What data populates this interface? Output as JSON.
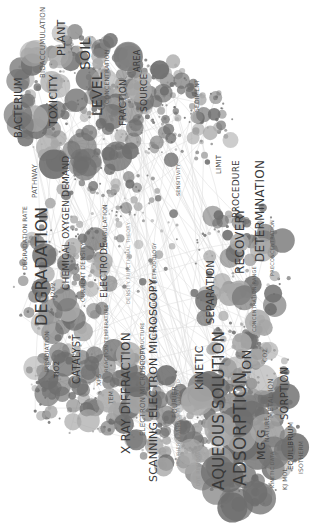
{
  "visualization": {
    "type": "term co-occurrence network",
    "orientation": "rotated 90deg counter-clockwise",
    "colors": {
      "background": "#ffffff",
      "node": "#6e6e6e",
      "node_light": "#a8a8a8",
      "edge": "#d6d6d6",
      "label": "#3a3a3a"
    }
  },
  "chart_data": {
    "type": "network",
    "clusters": [
      {
        "name": "environment",
        "nodes": [
          "SOIL",
          "LEVEL",
          "PLANT",
          "TOXICITY",
          "BACTERIUM",
          "BIOACCUMULATION",
          "FRACTION",
          "SOURCE",
          "AREA",
          "CONCENTRATION",
          "SEDIMENT",
          "LIMIT",
          "SENSITIVITY",
          "PATHWAY"
        ]
      },
      {
        "name": "degradation",
        "nodes": [
          "DEGRADATION",
          "DEGRADATION RATE",
          "CHEMICAL OXYGEN DEMAND",
          "CATALYST",
          "TIO2",
          "IRRADIATION",
          "ELECTRODE",
          "CURRENT DENSITY",
          "COAGULATION",
          "H2O2",
          "REACTION TEMPERATURE",
          "XPS",
          "TEM"
        ]
      },
      {
        "name": "characterization",
        "nodes": [
          "X RAY DIFFRACTION",
          "SCANNING ELECTRON MICROSCOPY",
          "ELECTRON MICROSCOPY",
          "FOURIER",
          "MICROSTRUCTURE",
          "RESPONSE SURFACE METHODOLOGY",
          "DENSITY FUNCTIONAL THEORY",
          "FOURIER TRANSFORM INFRARED",
          "DYE REMOVAL"
        ]
      },
      {
        "name": "adsorption",
        "nodes": [
          "ADSORPTION",
          "AQUEOUS SOLUTION",
          "ION",
          "KINETIC",
          "SORPTION",
          "MG G",
          "NATURE",
          "METAL ION",
          "EQUILIBRIUM",
          "ISOTHERM",
          "KINETIC DATA",
          "KJ MOL",
          "FREUNDLICH",
          "CO2"
        ]
      },
      {
        "name": "analysis",
        "nodes": [
          "DETERMINATION",
          "RECOVERY",
          "PROCEDURE",
          "SEPARATION",
          "CONCENTRATION RANGE",
          "PRECONCENTRATION"
        ]
      }
    ]
  },
  "labels": [
    {
      "text": "SOIL",
      "x": 78,
      "y": 70,
      "size": 14,
      "cls": ""
    },
    {
      "text": "LEVEL",
      "x": 90,
      "y": 116,
      "size": 14,
      "cls": ""
    },
    {
      "text": "PLANT",
      "x": 56,
      "y": 56,
      "size": 11,
      "cls": ""
    },
    {
      "text": "TOXICITY",
      "x": 48,
      "y": 126,
      "size": 11,
      "cls": ""
    },
    {
      "text": "BACTERIUM",
      "x": 14,
      "y": 138,
      "size": 10,
      "cls": ""
    },
    {
      "text": "BIOACCUMULATION",
      "x": 40,
      "y": 78,
      "size": 7,
      "cls": "mid"
    },
    {
      "text": "FRACTION",
      "x": 119,
      "y": 126,
      "size": 9,
      "cls": ""
    },
    {
      "text": "SOURCE",
      "x": 140,
      "y": 112,
      "size": 9,
      "cls": ""
    },
    {
      "text": "AREA",
      "x": 134,
      "y": 72,
      "size": 8,
      "cls": ""
    },
    {
      "text": "CONCENTRATION",
      "x": 104,
      "y": 104,
      "size": 6,
      "cls": "mid"
    },
    {
      "text": "SEDIMENT",
      "x": 194,
      "y": 112,
      "size": 6,
      "cls": "mid"
    },
    {
      "text": "LIMIT",
      "x": 216,
      "y": 174,
      "size": 7,
      "cls": ""
    },
    {
      "text": "SENSITIVITY",
      "x": 176,
      "y": 196,
      "size": 5,
      "cls": "mid"
    },
    {
      "text": "PATHWAY",
      "x": 32,
      "y": 198,
      "size": 7,
      "cls": "mid"
    },
    {
      "text": "DEGRADATION RATE",
      "x": 22,
      "y": 270,
      "size": 6,
      "cls": "mid"
    },
    {
      "text": "DEGRADATION",
      "x": 34,
      "y": 326,
      "size": 16,
      "cls": ""
    },
    {
      "text": "CHEMICAL OXYGEN DEMAND",
      "x": 62,
      "y": 290,
      "size": 9,
      "cls": ""
    },
    {
      "text": "H2O2",
      "x": 50,
      "y": 300,
      "size": 6,
      "cls": "mid"
    },
    {
      "text": "CURRENT DENSITY",
      "x": 80,
      "y": 302,
      "size": 6,
      "cls": "mid"
    },
    {
      "text": "ELECTRODE",
      "x": 100,
      "y": 298,
      "size": 9,
      "cls": ""
    },
    {
      "text": "COAGULATION",
      "x": 102,
      "y": 250,
      "size": 6,
      "cls": "mid"
    },
    {
      "text": "IRRADIATION",
      "x": 44,
      "y": 372,
      "size": 6,
      "cls": "mid"
    },
    {
      "text": "TIO2",
      "x": 54,
      "y": 378,
      "size": 7,
      "cls": ""
    },
    {
      "text": "CATALYST",
      "x": 72,
      "y": 384,
      "size": 10,
      "cls": ""
    },
    {
      "text": "REACTION TEMPERATURE",
      "x": 104,
      "y": 372,
      "size": 5,
      "cls": "mid"
    },
    {
      "text": "XPS",
      "x": 96,
      "y": 386,
      "size": 6,
      "cls": "mid"
    },
    {
      "text": "TEM",
      "x": 108,
      "y": 404,
      "size": 6,
      "cls": "mid"
    },
    {
      "text": "MICROSTRUCTURE",
      "x": 140,
      "y": 372,
      "size": 5,
      "cls": "mid"
    },
    {
      "text": "RESPONSE SURFACE METHODOLOGY",
      "x": 152,
      "y": 340,
      "size": 5,
      "cls": "mid"
    },
    {
      "text": "DENSITY FUNCTIONAL THEORY",
      "x": 126,
      "y": 304,
      "size": 5,
      "cls": "faint"
    },
    {
      "text": "X RAY DIFFRACTION",
      "x": 120,
      "y": 454,
      "size": 12,
      "cls": ""
    },
    {
      "text": "ELECTRON MICROSCOPY",
      "x": 140,
      "y": 436,
      "size": 7,
      "cls": "mid"
    },
    {
      "text": "SCANNING ELECTRON MICROSCOPY",
      "x": 148,
      "y": 482,
      "size": 11,
      "cls": ""
    },
    {
      "text": "FOURIER",
      "x": 172,
      "y": 418,
      "size": 7,
      "cls": "mid"
    },
    {
      "text": "FOURIER TRANSFORM INFRARED",
      "x": 176,
      "y": 466,
      "size": 5,
      "cls": "faint"
    },
    {
      "text": "DYE REMOVAL",
      "x": 196,
      "y": 486,
      "size": 5,
      "cls": "faint"
    },
    {
      "text": "KINETIC",
      "x": 194,
      "y": 390,
      "size": 11,
      "cls": ""
    },
    {
      "text": "AQUEOUS SOLUTION",
      "x": 212,
      "y": 490,
      "size": 15,
      "cls": ""
    },
    {
      "text": "ADSORPTION",
      "x": 232,
      "y": 486,
      "size": 17,
      "cls": ""
    },
    {
      "text": "ION",
      "x": 240,
      "y": 374,
      "size": 13,
      "cls": ""
    },
    {
      "text": "MG G",
      "x": 256,
      "y": 460,
      "size": 11,
      "cls": ""
    },
    {
      "text": "NATURE",
      "x": 264,
      "y": 442,
      "size": 6,
      "cls": "mid"
    },
    {
      "text": "METAL ION",
      "x": 268,
      "y": 418,
      "size": 7,
      "cls": "mid"
    },
    {
      "text": "CO2",
      "x": 262,
      "y": 362,
      "size": 6,
      "cls": "mid"
    },
    {
      "text": "SORPTION",
      "x": 280,
      "y": 420,
      "size": 10,
      "cls": ""
    },
    {
      "text": "EQUILIBRIUM",
      "x": 288,
      "y": 470,
      "size": 7,
      "cls": ""
    },
    {
      "text": "ISOTHERM",
      "x": 298,
      "y": 474,
      "size": 6,
      "cls": "mid"
    },
    {
      "text": "KINETIC DATA",
      "x": 270,
      "y": 488,
      "size": 5,
      "cls": "mid"
    },
    {
      "text": "KJ MOL",
      "x": 282,
      "y": 490,
      "size": 6,
      "cls": "mid"
    },
    {
      "text": "SEPARATION",
      "x": 206,
      "y": 324,
      "size": 10,
      "cls": ""
    },
    {
      "text": "RECOVERY",
      "x": 234,
      "y": 274,
      "size": 12,
      "cls": ""
    },
    {
      "text": "PROCEDURE",
      "x": 232,
      "y": 218,
      "size": 9,
      "cls": ""
    },
    {
      "text": "DETERMINATION",
      "x": 254,
      "y": 262,
      "size": 12,
      "cls": ""
    },
    {
      "text": "CONCENTRATION RANGE",
      "x": 252,
      "y": 332,
      "size": 5,
      "cls": "mid"
    },
    {
      "text": "PRECONCENTRATION",
      "x": 270,
      "y": 276,
      "size": 5,
      "cls": "mid"
    }
  ]
}
